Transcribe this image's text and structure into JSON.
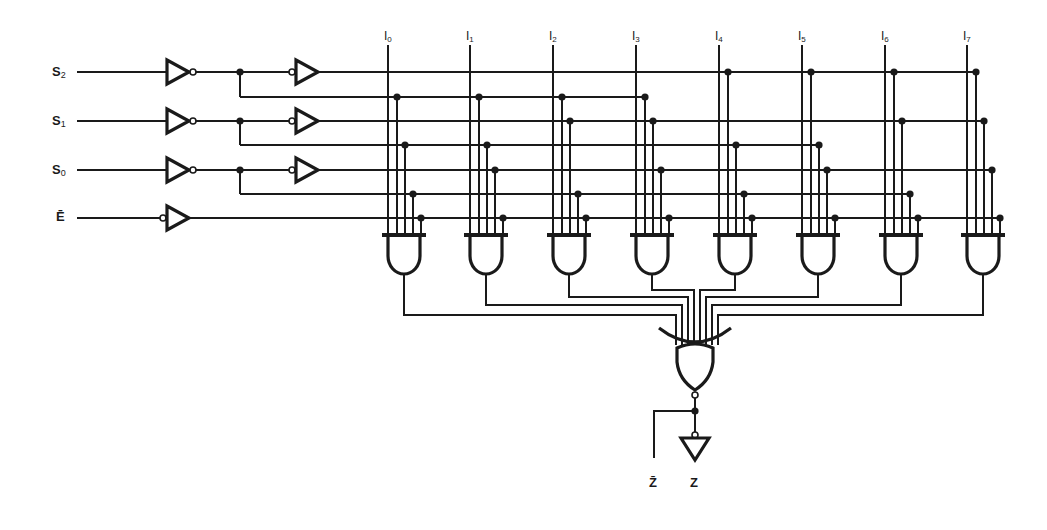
{
  "diagram": {
    "colors": {
      "ink": "#1a1a1a",
      "background": "#ffffff"
    },
    "inputs": [
      {
        "id": "S2",
        "base": "S",
        "sub": "2",
        "y": 72,
        "inv_y": 97
      },
      {
        "id": "S1",
        "base": "S",
        "sub": "1",
        "y": 121,
        "inv_y": 145
      },
      {
        "id": "S0",
        "base": "S",
        "sub": "0",
        "y": 170,
        "inv_y": 194
      }
    ],
    "enable": {
      "id": "E_bar",
      "label": "Ē",
      "y": 218
    },
    "data_inputs": [
      {
        "base": "I",
        "sub": "0",
        "x": 388
      },
      {
        "base": "I",
        "sub": "1",
        "x": 470
      },
      {
        "base": "I",
        "sub": "2",
        "x": 553
      },
      {
        "base": "I",
        "sub": "3",
        "x": 636
      },
      {
        "base": "I",
        "sub": "4",
        "x": 719
      },
      {
        "base": "I",
        "sub": "5",
        "x": 802
      },
      {
        "base": "I",
        "sub": "6",
        "x": 885
      },
      {
        "base": "I",
        "sub": "7",
        "x": 967
      }
    ],
    "outputs": [
      {
        "id": "Z_bar",
        "label": "Z̄",
        "x": 654
      },
      {
        "id": "Z",
        "label": "Z",
        "x": 695
      }
    ],
    "gates": {
      "input_inverters": 4,
      "buffers": 3,
      "and_gates": 8,
      "nor_gate": 1,
      "output_inverter": 1
    }
  }
}
